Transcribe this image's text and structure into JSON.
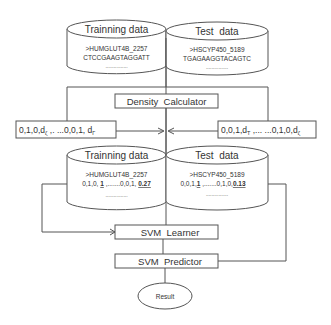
{
  "diagram": {
    "colors": {
      "stroke": "#555555",
      "text": "#333333",
      "background": "#ffffff"
    },
    "top_databases": {
      "training": {
        "title": "Trainning data",
        "id_line": ">HUMGLUT4B_2257",
        "seq_line": "CTCCGAAGTAGGATT",
        "ellipsis": "................"
      },
      "test": {
        "title": "Test  data",
        "id_line": ">HSCYP450_5189",
        "seq_line": "TGAGAAGGTACAGTC",
        "ellipsis": "................"
      }
    },
    "density_calculator": {
      "label": "Density  Calculator"
    },
    "feature_vectors": {
      "left": {
        "prefix": "0,1,0,d",
        "sub1": "ζ",
        "middle": " ,. ...0,0,1, d",
        "sub2": "Γ"
      },
      "right": {
        "prefix": "0,0,1,d",
        "sub1": "T",
        "middle": " ,... ...0,1,0,d",
        "sub2": "ζ"
      }
    },
    "bottom_databases": {
      "training": {
        "title": "Trainning data",
        "id_line": ">HUMGLUT4B_2257",
        "vec_prefix": "0,1,0, ",
        "vec_bold1": "1",
        "vec_mid": " ,.......0,0,1, ",
        "vec_bold2": "0.27",
        "ellipsis": "................"
      },
      "test": {
        "title": "Test  data",
        "id_line": ">HSCYP450_5189",
        "vec_prefix": "0,0,1,",
        "vec_bold1": "1",
        "vec_mid": " ,.......0,1,0,",
        "vec_bold2": "0.13",
        "ellipsis": "................"
      }
    },
    "svm_learner": {
      "label": "SVM  Learner"
    },
    "svm_predictor": {
      "label": "SVM  Predictor"
    },
    "result": {
      "label": "Result"
    }
  }
}
